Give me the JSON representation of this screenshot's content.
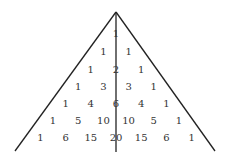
{
  "diagram": {
    "apex": [
      116,
      12
    ],
    "left_end": [
      15,
      151
    ],
    "right_end": [
      215,
      151
    ],
    "axis_end": [
      116,
      152
    ],
    "line_color": "#222222",
    "text_color": "#333333",
    "row_y": [
      34,
      52,
      70,
      87,
      104,
      121,
      138
    ],
    "col_step": 12.6,
    "rows": [
      [
        1
      ],
      [
        1,
        1
      ],
      [
        1,
        2,
        1
      ],
      [
        1,
        3,
        3,
        1
      ],
      [
        1,
        4,
        6,
        4,
        1
      ],
      [
        1,
        5,
        10,
        10,
        5,
        1
      ],
      [
        1,
        6,
        15,
        20,
        15,
        6,
        1
      ]
    ]
  }
}
